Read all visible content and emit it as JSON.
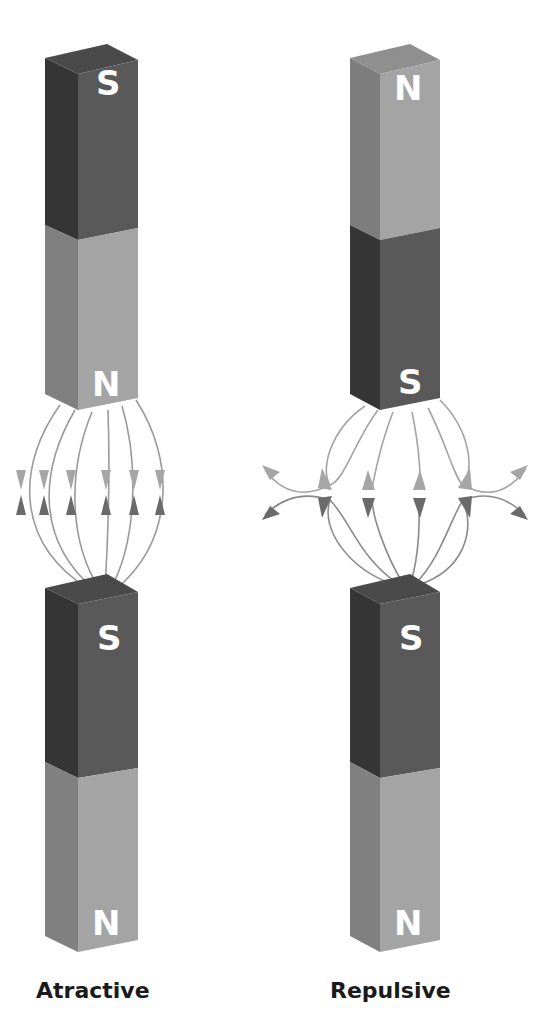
{
  "diagram": {
    "panels": [
      {
        "id": "attractive",
        "caption": "Atractive",
        "top_magnet": {
          "upper_pole": "S",
          "lower_pole": "N"
        },
        "bottom_magnet": {
          "upper_pole": "S",
          "lower_pole": "N"
        },
        "field": "lines run from N pole down to S pole; arrows point toward each other at mid gap"
      },
      {
        "id": "repulsive",
        "caption": "Repulsive",
        "top_magnet": {
          "upper_pole": "N",
          "lower_pole": "S"
        },
        "bottom_magnet": {
          "upper_pole": "S",
          "lower_pole": "N"
        },
        "field": "lines from both S poles bend away sideways; arrows diverge"
      }
    ],
    "colors": {
      "south_front": "#5a5a5a",
      "south_side": "#3a3a3a",
      "south_top": "#4a4a4a",
      "north_front": "#a3a3a3",
      "north_side": "#7d7d7d",
      "north_top": "#8f8f8f",
      "field_line": "#9a9a9a",
      "arrow_light": "#a8a8a8",
      "arrow_dark": "#6c6c6c",
      "label": "#ffffff"
    }
  }
}
